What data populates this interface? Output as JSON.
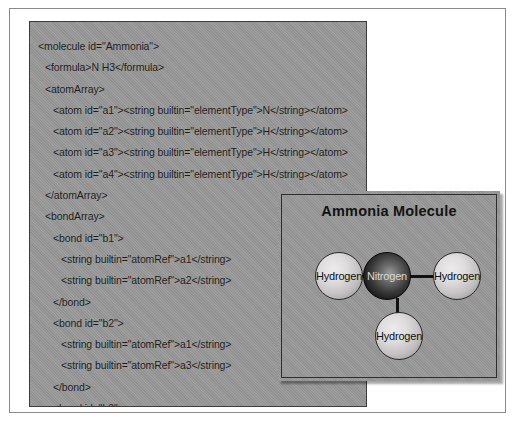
{
  "xml_panel": {
    "lines": [
      {
        "indent": 0,
        "text": "<molecule id=\"Ammonia\">"
      },
      {
        "indent": 1,
        "text": "<formula>N H3</formula>"
      },
      {
        "indent": 1,
        "text": "<atomArray>"
      },
      {
        "indent": 2,
        "text": "<atom id=\"a1\"><string builtin=\"elementType\">N</string></atom>"
      },
      {
        "indent": 2,
        "text": "<atom id=\"a2\"><string builtin=\"elementType\">H</string></atom>"
      },
      {
        "indent": 2,
        "text": "<atom id=\"a3\"><string builtin=\"elementType\">H</string></atom>"
      },
      {
        "indent": 2,
        "text": "<atom id=\"a4\"><string builtin=\"elementType\">H</string></atom>"
      },
      {
        "indent": 1,
        "text": "</atomArray>"
      },
      {
        "indent": 1,
        "text": "<bondArray>"
      },
      {
        "indent": 2,
        "text": "<bond id=\"b1\">"
      },
      {
        "indent": 3,
        "text": "<string builtin=\"atomRef\">a1</string>"
      },
      {
        "indent": 3,
        "text": "<string builtin=\"atomRef\">a2</string>"
      },
      {
        "indent": 2,
        "text": "</bond>"
      },
      {
        "indent": 2,
        "text": "<bond id=\"b2\">"
      },
      {
        "indent": 3,
        "text": "<string builtin=\"atomRef\">a1</string>"
      },
      {
        "indent": 3,
        "text": "<string builtin=\"atomRef\">a3</string>"
      },
      {
        "indent": 2,
        "text": "</bond>"
      },
      {
        "indent": 2,
        "text": "<bond id=\"b3\">"
      },
      {
        "indent": 3,
        "text": "<string builtin=\"atomRef\">a1</string>"
      },
      {
        "indent": 3,
        "text": "<string builtin=\"atomRef\">a4</string>"
      },
      {
        "indent": 2,
        "text": "</bond>"
      },
      {
        "indent": 1,
        "text": "</bondArray>"
      },
      {
        "indent": 0,
        "text": "</molecule>"
      }
    ]
  },
  "diagram": {
    "title": "Ammonia Molecule",
    "atoms": {
      "hydrogen_left": "Hydrogen",
      "nitrogen": "Nitrogen",
      "hydrogen_right": "Hydrogen",
      "hydrogen_bottom": "Hydrogen"
    },
    "colors": {
      "panel_background": "#989898",
      "panel_border": "#2e2e2e",
      "bond": "#111111",
      "nitrogen_fill": "#141414",
      "hydrogen_fill": "#dedcdc",
      "text": "#131313"
    }
  }
}
